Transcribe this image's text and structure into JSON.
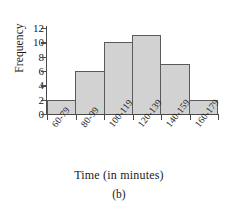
{
  "chart_data": {
    "type": "bar",
    "title": "",
    "subtitle": "",
    "categories": [
      "60-79",
      "80-99",
      "100-119",
      "120-139",
      "140-159",
      "160-179"
    ],
    "values": [
      2,
      6,
      10,
      11,
      7,
      2
    ],
    "xlabel": "Time (in minutes)",
    "ylabel": "Frequency",
    "ylim": [
      0,
      12
    ],
    "yticks": [
      0,
      2,
      4,
      6,
      8,
      10,
      12
    ],
    "ytick_labels": [
      "0",
      "2",
      "4",
      "6",
      "8",
      "10",
      "12"
    ],
    "grid": false,
    "legend": "none",
    "bar_fill_color": "#d2d2d2",
    "bar_edge_color": "#5a5a5a",
    "axis_color": "#4a4a4a",
    "background_color": "#ffffff",
    "xtick_label_rotation": -52,
    "bar_gap": 0
  },
  "caption": {
    "text": "(b)"
  }
}
